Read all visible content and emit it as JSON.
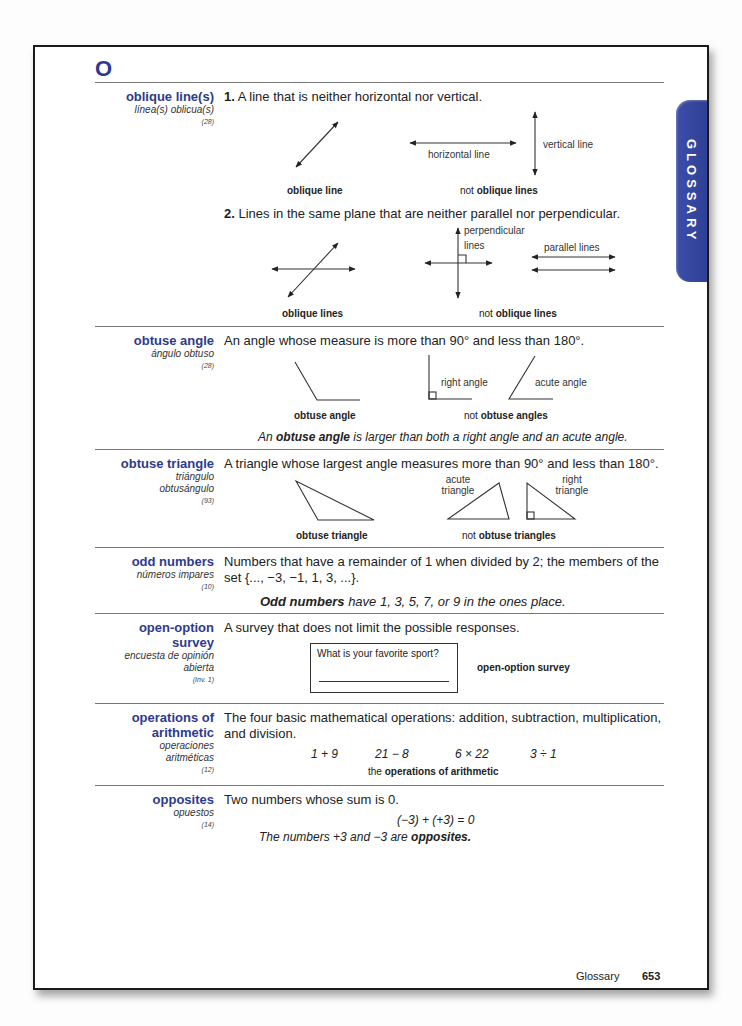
{
  "tab_label": "GLOSSARY",
  "section_letter": "O",
  "entries": {
    "oblique": {
      "term": "oblique line(s)",
      "spanish": "línea(s) oblicua(s)",
      "lesson": "(28)",
      "def1_num": "1.",
      "def1": "A line that is neither horizontal nor vertical.",
      "fig1_caption": "oblique line",
      "horizontal_label": "horizontal line",
      "vertical_label": "vertical line",
      "fig2_caption_prefix": "not ",
      "fig2_caption_bold": "oblique lines",
      "def2_num": "2.",
      "def2": "Lines in the same plane that are neither parallel nor perpendicular.",
      "fig3_caption": "oblique lines",
      "perp_label_1": "perpendicular",
      "perp_label_2": "lines",
      "parallel_label": "parallel lines",
      "fig4_caption_prefix": "not ",
      "fig4_caption_bold": "oblique lines"
    },
    "obtuse_angle": {
      "term": "obtuse angle",
      "spanish": "ángulo obtuso",
      "lesson": "(28)",
      "def": "An angle whose measure is more than 90° and less than 180°.",
      "fig1_caption": "obtuse angle",
      "right_label": "right angle",
      "acute_label": "acute angle",
      "fig2_caption_prefix": "not ",
      "fig2_caption_bold": "obtuse angles",
      "note_prefix": "An ",
      "note_bold": "obtuse angle",
      "note_suffix": " is larger than both a right angle and an acute angle."
    },
    "obtuse_triangle": {
      "term": "obtuse triangle",
      "spanish_1": "triángulo",
      "spanish_2": "obtusángulo",
      "lesson": "(93)",
      "def": "A triangle whose largest angle measures more than 90° and less than 180°.",
      "fig1_caption": "obtuse triangle",
      "acute_label_1": "acute",
      "acute_label_2": "triangle",
      "right_label_1": "right",
      "right_label_2": "triangle",
      "fig2_caption_prefix": "not ",
      "fig2_caption_bold": "obtuse triangles"
    },
    "odd_numbers": {
      "term": "odd numbers",
      "spanish": "números impares",
      "lesson": "(10)",
      "def_line1": "Numbers that have a remainder of 1 when divided by 2; the members of the",
      "def_line2": "set {..., −3, −1, 1, 3, ...}.",
      "note_bold": "Odd numbers",
      "note_suffix": " have 1, 3, 5, 7, or 9 in the ones place."
    },
    "open_option": {
      "term_1": "open-option",
      "term_2": "survey",
      "spanish_1": "encuesta de opinión",
      "spanish_2": "abierta",
      "lesson": "(Inv. 1)",
      "def": "A survey that does not limit the possible responses.",
      "survey_question": "What is your favorite sport?",
      "caption": "open-option survey"
    },
    "operations": {
      "term_1": "operations of",
      "term_2": "arithmetic",
      "spanish_1": "operaciones",
      "spanish_2": "aritméticas",
      "lesson": "(12)",
      "def_line1": "The four basic mathematical operations: addition, subtraction, multiplication,",
      "def_line2": "and division.",
      "examples": [
        "1 + 9",
        "21 − 8",
        "6 × 22",
        "3 ÷ 1"
      ],
      "caption_prefix": "the ",
      "caption_bold": "operations of arithmetic"
    },
    "opposites": {
      "term": "opposites",
      "spanish": "opuestos",
      "lesson": "(14)",
      "def": "Two numbers whose sum is 0.",
      "equation": "(−3) + (+3) = 0",
      "note_prefix": "The numbers +3 and −3 are ",
      "note_bold": "opposites."
    }
  },
  "footer": {
    "section": "Glossary",
    "page_number": "653"
  }
}
